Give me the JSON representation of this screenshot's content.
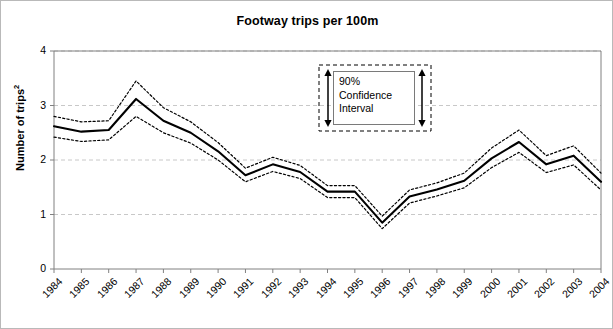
{
  "chart_data": {
    "type": "line",
    "title": "Footway trips per 100m",
    "xlabel": "",
    "ylabel": "Number of trips",
    "ylabel_superscript": "2",
    "ylim": [
      0,
      4
    ],
    "yticks": [
      0,
      1,
      2,
      3,
      4
    ],
    "grid": true,
    "grid_axis": "y",
    "legend_position": "inside-upper-center",
    "categories": [
      "1984",
      "1985",
      "1986",
      "1987",
      "1988",
      "1989",
      "1990",
      "1991",
      "1992",
      "1993",
      "1994",
      "1995",
      "1996",
      "1997",
      "1998",
      "1999",
      "2000",
      "2001",
      "2002",
      "2003",
      "2004"
    ],
    "series": [
      {
        "name": "Estimate",
        "style": "solid",
        "color": "#000000",
        "values": [
          2.62,
          2.52,
          2.55,
          3.12,
          2.72,
          2.5,
          2.16,
          1.72,
          1.92,
          1.78,
          1.42,
          1.42,
          0.85,
          1.33,
          1.46,
          1.62,
          2.03,
          2.33,
          1.92,
          2.08,
          1.6
        ]
      },
      {
        "name": "Upper 90% confidence limit",
        "style": "dotted",
        "color": "#000000",
        "values": [
          2.8,
          2.7,
          2.72,
          3.45,
          2.96,
          2.7,
          2.32,
          1.85,
          2.05,
          1.9,
          1.53,
          1.53,
          0.97,
          1.45,
          1.58,
          1.76,
          2.22,
          2.55,
          2.08,
          2.26,
          1.76
        ]
      },
      {
        "name": "Lower 90% confidence limit",
        "style": "dotted",
        "color": "#000000",
        "values": [
          2.42,
          2.34,
          2.37,
          2.8,
          2.5,
          2.31,
          2.0,
          1.6,
          1.79,
          1.66,
          1.31,
          1.31,
          0.74,
          1.21,
          1.34,
          1.49,
          1.86,
          2.14,
          1.77,
          1.91,
          1.45
        ]
      }
    ],
    "annotations": [
      {
        "type": "confidence-interval-key",
        "lines": [
          "90%",
          "Confidence",
          "Interval"
        ]
      }
    ]
  },
  "legend": {
    "line_1": "90%",
    "line_2": "Confidence",
    "line_3": "Interval"
  },
  "colors": {
    "line": "#000000",
    "grid": "#c8c8c8",
    "axis": "#808080",
    "frame_border": "#b9b9b9",
    "background": "#ffffff"
  }
}
